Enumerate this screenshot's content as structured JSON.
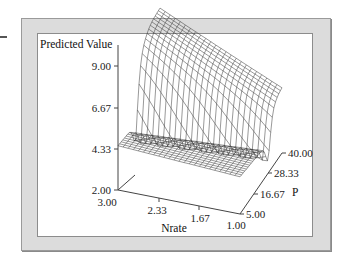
{
  "chart_data": {
    "type": "surface3d",
    "title": "",
    "zlabel": "Predicted Value",
    "xlabel": "Nrate",
    "ylabel": "P",
    "z_ticks": [
      "2.00",
      "4.33",
      "6.67",
      "9.00"
    ],
    "x_ticks": [
      "3.00",
      "2.33",
      "1.67",
      "1.00"
    ],
    "y_ticks": [
      "5.00",
      "16.67",
      "28.33",
      "40.00"
    ],
    "zlim": [
      2.0,
      9.0
    ],
    "xlim": [
      3.0,
      1.0
    ],
    "ylim": [
      5.0,
      40.0
    ]
  },
  "plot": {
    "z_title": "Predicted Value",
    "x_title": "Nrate",
    "y_title": "P",
    "z_ticks": [
      {
        "label": "9.00"
      },
      {
        "label": "6.67"
      },
      {
        "label": "4.33"
      },
      {
        "label": "2.00"
      }
    ],
    "x_ticks": [
      {
        "label": "3.00"
      },
      {
        "label": "2.33"
      },
      {
        "label": "1.67"
      },
      {
        "label": "1.00"
      }
    ],
    "y_ticks": [
      {
        "label": "5.00"
      },
      {
        "label": "16.67"
      },
      {
        "label": "28.33"
      },
      {
        "label": "40.00"
      }
    ]
  }
}
